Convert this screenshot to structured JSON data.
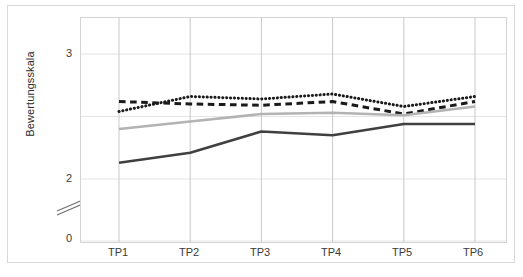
{
  "chart_data": {
    "type": "line",
    "title": "",
    "xlabel": "",
    "ylabel": "Bewertungsskala",
    "categories": [
      "TP1",
      "TP2",
      "TP3",
      "TP4",
      "TP5",
      "TP6"
    ],
    "ylim": [
      0,
      3.2
    ],
    "yticks": [
      0,
      2,
      3
    ],
    "ytick_labels": [
      "0",
      "2",
      "3"
    ],
    "axis_break": true,
    "axis_break_between": [
      0,
      2
    ],
    "grid": "horizontal-faint",
    "gridlines": [
      2,
      2.5,
      3
    ],
    "legend": "none",
    "series": [
      {
        "name": "dotted-series",
        "style": "dotted",
        "color": "#1a1a1a",
        "values": [
          2.54,
          2.66,
          2.64,
          2.68,
          2.58,
          2.66
        ]
      },
      {
        "name": "dashed-series",
        "style": "dashed",
        "color": "#1a1a1a",
        "values": [
          2.62,
          2.6,
          2.59,
          2.62,
          2.52,
          2.62
        ]
      },
      {
        "name": "light-gray-solid-series",
        "style": "solid",
        "color": "#b3b3b3",
        "values": [
          2.4,
          2.46,
          2.52,
          2.53,
          2.51,
          2.58
        ]
      },
      {
        "name": "dark-solid-series",
        "style": "solid",
        "color": "#404040",
        "values": [
          2.13,
          2.21,
          2.38,
          2.35,
          2.44,
          2.44
        ]
      }
    ]
  },
  "axis": {
    "y_label": "Bewertungsskala",
    "y_tick_0": "0",
    "y_tick_2": "2",
    "y_tick_3": "3",
    "x_tick_1": "TP1",
    "x_tick_2": "TP2",
    "x_tick_3": "TP3",
    "x_tick_4": "TP4",
    "x_tick_5": "TP5",
    "x_tick_6": "TP6"
  },
  "colors": {
    "dotted": "#1a1a1a",
    "dashed": "#1a1a1a",
    "gray_line": "#b3b3b3",
    "dark_line": "#404040",
    "grid": "#e4e4e4",
    "frame": "#d9d9d9",
    "text": "#3a3a3a"
  }
}
